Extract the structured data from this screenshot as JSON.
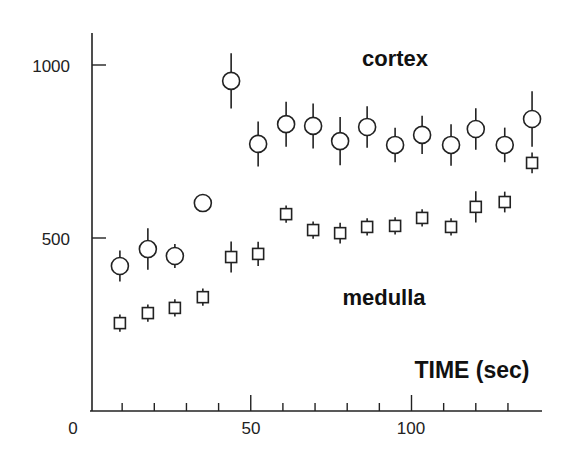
{
  "chart_data": {
    "type": "scatter",
    "title": "",
    "xlabel": "TIME (sec)",
    "ylabel": "",
    "xlim": [
      0,
      140
    ],
    "ylim": [
      0,
      1100
    ],
    "x_ticks_major": [
      0,
      50,
      100
    ],
    "x_tick_labels": [
      "0",
      "50",
      "100"
    ],
    "x_ticks_minor_step": 10,
    "y_ticks": [
      500,
      1000
    ],
    "y_tick_labels": [
      "500",
      "1000"
    ],
    "grid": false,
    "legend": "inline text labels",
    "x": [
      9.3,
      18.0,
      26.4,
      35.1,
      43.9,
      52.3,
      61.0,
      69.4,
      77.8,
      86.2,
      94.9,
      103.3,
      112.3,
      120.0,
      129.0,
      137.5
    ],
    "series": [
      {
        "name": "cortex",
        "marker": "circle",
        "values": [
          419,
          468,
          448,
          601,
          954,
          772,
          829,
          824,
          780,
          821,
          769,
          798,
          769,
          815,
          769,
          844
        ],
        "errors": [
          45,
          60,
          35,
          25,
          80,
          65,
          65,
          65,
          70,
          60,
          50,
          55,
          60,
          60,
          50,
          80
        ]
      },
      {
        "name": "medulla",
        "marker": "square",
        "values": [
          254,
          283,
          298,
          329,
          445,
          454,
          569,
          523,
          514,
          532,
          535,
          558,
          532,
          590,
          604,
          717
        ],
        "errors": [
          25,
          25,
          25,
          25,
          45,
          35,
          25,
          25,
          30,
          25,
          25,
          25,
          25,
          45,
          30,
          30
        ]
      }
    ],
    "annotations": [
      {
        "text": "cortex",
        "x": 395,
        "y": 65
      },
      {
        "text": "medulla",
        "x": 385,
        "y": 305
      },
      {
        "text": "TIME (sec)",
        "x": 470,
        "y": 378
      }
    ]
  },
  "labels": {
    "cortex": "cortex",
    "medulla": "medulla",
    "xlabel": "TIME (sec)",
    "x0": "0",
    "x50": "50",
    "x100": "100",
    "y500": "500",
    "y1000": "1000"
  }
}
